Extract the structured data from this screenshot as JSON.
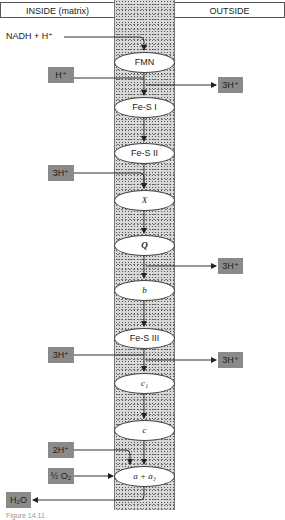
{
  "header": {
    "inside_label": "INSIDE (matrix)",
    "outside_label": "OUTSIDE"
  },
  "input_label": "NADH + H⁺",
  "chain": [
    {
      "id": "fmn",
      "label": "FMN"
    },
    {
      "id": "fes1",
      "label": "Fe-S I"
    },
    {
      "id": "fes2",
      "label": "Fe-S II"
    },
    {
      "id": "x",
      "label": "X"
    },
    {
      "id": "q",
      "label": "Q"
    },
    {
      "id": "b",
      "label": "b"
    },
    {
      "id": "fes3",
      "label": "Fe-S III"
    },
    {
      "id": "c1",
      "label": "c₁"
    },
    {
      "id": "c",
      "label": "c"
    },
    {
      "id": "aa3",
      "label": "a + a₃"
    }
  ],
  "inside_boxes": {
    "h_fmn": "H⁺",
    "h_x": "3H⁺",
    "h_fes3": "3H⁺",
    "h_aa3": "2H⁺",
    "o2": "½ O₂",
    "h2o": "H₂O"
  },
  "outside_boxes": {
    "out_fes1": "3H⁺",
    "out_q": "3H⁺",
    "out_c1": "3H⁺"
  },
  "colors": {
    "box_fill": "#8a8a8a",
    "membrane": "#d8d8d8",
    "line": "#333333"
  },
  "caption": "Figure 14.11"
}
